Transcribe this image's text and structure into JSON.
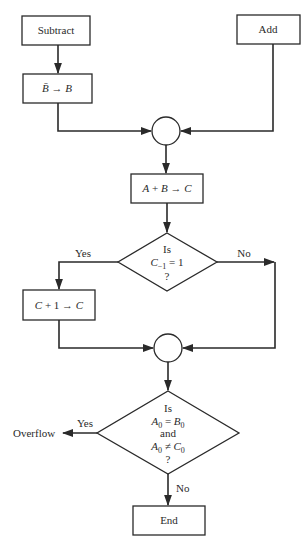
{
  "diagram": {
    "type": "flowchart",
    "title": "",
    "nodes": [
      {
        "id": "subtract",
        "shape": "process",
        "label": "Subtract"
      },
      {
        "id": "add",
        "shape": "process",
        "label": "Add"
      },
      {
        "id": "complement",
        "shape": "process",
        "label_parts": [
          "B̄",
          " → ",
          "B"
        ]
      },
      {
        "id": "join1",
        "shape": "connector",
        "label": ""
      },
      {
        "id": "sum",
        "shape": "process",
        "label_parts": [
          "A",
          " + ",
          "B",
          " → ",
          "C"
        ]
      },
      {
        "id": "carry-check",
        "shape": "decision",
        "line1": "Is",
        "line2_var": "C",
        "line2_sub": "−1",
        "line2_rest": " = 1",
        "line3": "?"
      },
      {
        "id": "increment",
        "shape": "process",
        "label_parts": [
          "C",
          " + 1 → ",
          "C"
        ]
      },
      {
        "id": "join2",
        "shape": "connector",
        "label": ""
      },
      {
        "id": "overflow-check",
        "shape": "decision",
        "line1": "Is",
        "line2_a": "A",
        "line2_a_sub": "0",
        "line2_op": " = ",
        "line2_b": "B",
        "line2_b_sub": "0",
        "line3": "and",
        "line4_a": "A",
        "line4_a_sub": "0",
        "line4_op": " ≠ ",
        "line4_b": "C",
        "line4_b_sub": "0",
        "line5": "?"
      },
      {
        "id": "end",
        "shape": "terminal",
        "label": "End"
      }
    ],
    "edges": [
      {
        "from": "subtract",
        "to": "complement",
        "label": ""
      },
      {
        "from": "complement",
        "to": "join1",
        "label": ""
      },
      {
        "from": "add",
        "to": "join1",
        "label": ""
      },
      {
        "from": "join1",
        "to": "sum",
        "label": ""
      },
      {
        "from": "sum",
        "to": "carry-check",
        "label": ""
      },
      {
        "from": "carry-check",
        "to": "increment",
        "label": "Yes"
      },
      {
        "from": "carry-check",
        "to": "join2",
        "label": "No"
      },
      {
        "from": "increment",
        "to": "join2",
        "label": ""
      },
      {
        "from": "join2",
        "to": "overflow-check",
        "label": ""
      },
      {
        "from": "overflow-check",
        "to": "overflow",
        "label": "Yes"
      },
      {
        "from": "overflow-check",
        "to": "end",
        "label": "No"
      }
    ],
    "labels": {
      "subtract": "Subtract",
      "add": "Add",
      "end": "End",
      "overflow": "Overflow",
      "yes": "Yes",
      "no": "No",
      "is": "Is",
      "and": "and",
      "q": "?"
    }
  }
}
